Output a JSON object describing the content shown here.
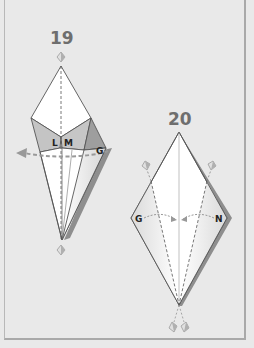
{
  "steps": [
    {
      "number": "19",
      "labels": {
        "l": "L",
        "m": "M",
        "g": "G"
      },
      "arrow": "dashed-fold-arrow-left"
    },
    {
      "number": "20",
      "labels": {
        "g": "G",
        "n": "N"
      },
      "arrow": "dashed-fold-arrows-to-center"
    }
  ],
  "colors": {
    "background": "#e9e9e9",
    "paper": "#ffffff",
    "shade_light": "#c4c4c4",
    "shade_dark": "#9e9e9e",
    "line": "#555555",
    "arrow": "#999999",
    "frame": "#a9a9a9"
  }
}
